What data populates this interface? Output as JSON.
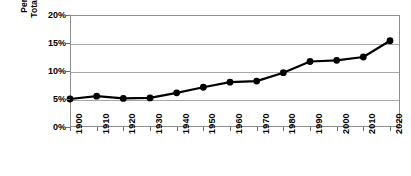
{
  "chart_data": {
    "type": "line",
    "title": "",
    "subtitle": "",
    "xlabel": "",
    "ylabel": "Percentage of Total Population",
    "ylabel_line1": "Percentage of",
    "ylabel_line2": "Total Population",
    "categories": [
      "1900",
      "1910",
      "1920",
      "1930",
      "1940",
      "1950",
      "1960",
      "1970",
      "1980",
      "1990",
      "2000",
      "2010",
      "2020"
    ],
    "x": [
      1900,
      1910,
      1920,
      1930,
      1940,
      1950,
      1960,
      1970,
      1980,
      1990,
      2000,
      2010,
      2020
    ],
    "values": [
      5.0,
      5.5,
      5.1,
      5.2,
      6.1,
      7.1,
      8.0,
      8.2,
      9.7,
      11.7,
      11.9,
      12.5,
      15.4
    ],
    "series": [
      {
        "name": "Percentage of Total Population",
        "values": [
          5.0,
          5.5,
          5.1,
          5.2,
          6.1,
          7.1,
          8.0,
          8.2,
          9.7,
          11.7,
          11.9,
          12.5,
          15.4
        ]
      }
    ],
    "ylim": [
      0,
      20
    ],
    "xlim": [
      1900,
      2020
    ],
    "ytick_labels": [
      "20%",
      "15%",
      "10%",
      "5%",
      "0%"
    ],
    "ytick_values": [
      20,
      15,
      10,
      5,
      0
    ],
    "grid": "horizontal",
    "legend": "none",
    "marker": "filled-circle",
    "line_color": "#000000",
    "marker_color": "#000000",
    "grid_color": "#a8a8a8",
    "frame_color": "#8e8e8e",
    "background_color": "#ffffff"
  }
}
